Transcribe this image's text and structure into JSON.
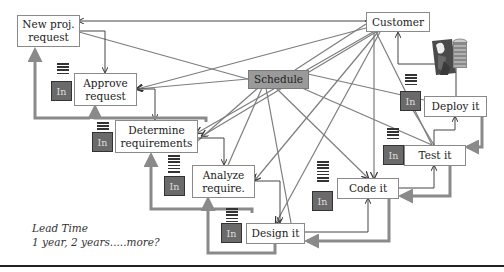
{
  "diagram": {
    "nodes": {
      "new_request": "New proj. request",
      "approve": "Approve request",
      "determine": "Determine requirements",
      "analyze": "Analyze require.",
      "design": "Design it",
      "code": "Code it",
      "test": "Test it",
      "deploy": "Deploy it",
      "customer": "Customer",
      "schedule": "Schedule"
    },
    "inbox_label": "In",
    "inboxes": [
      "In",
      "In",
      "In",
      "In",
      "In",
      "In",
      "In"
    ],
    "lead_time": {
      "line1": "Lead Time",
      "line2": "1 year, 2 years.....more?"
    },
    "icons": {
      "server": "server-and-person-icon"
    },
    "colors": {
      "schedule_fill": "#9a9a9a",
      "inbox_fill": "#6a6a6a",
      "thin_arrow": "#444444",
      "thick_arrow": "#8a8a8a"
    }
  }
}
